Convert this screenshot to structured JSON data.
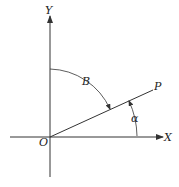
{
  "diagram": {
    "type": "coordinate-angle-diagram",
    "labels": {
      "y_axis": "Y",
      "x_axis": "X",
      "origin": "O",
      "point": "P",
      "angle_from_y": "B",
      "angle_from_x": "α"
    },
    "colors": {
      "stroke": "#333333",
      "background": "#ffffff"
    }
  }
}
